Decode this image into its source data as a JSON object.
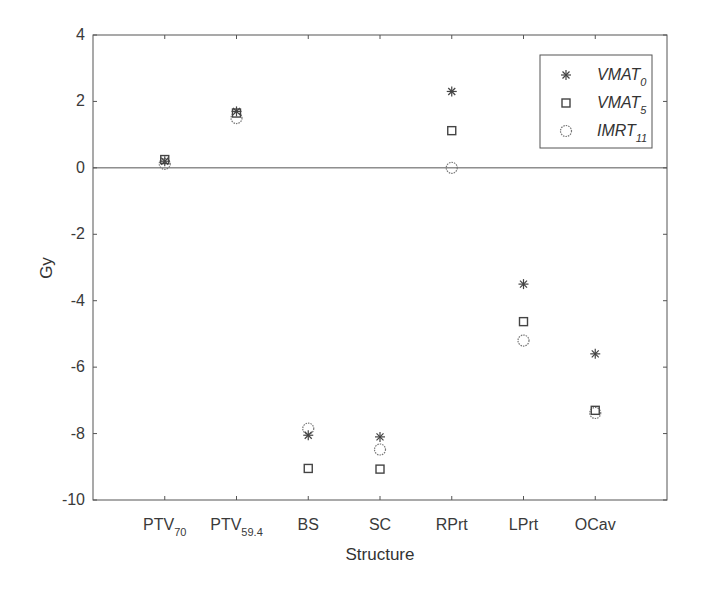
{
  "chart_data": {
    "type": "scatter",
    "title": "",
    "xlabel": "Structure",
    "ylabel": "Gy",
    "ylim": [
      -10,
      4
    ],
    "xlim": [
      0,
      8
    ],
    "yticks": [
      -10,
      -8,
      -6,
      -4,
      -2,
      0,
      2,
      4
    ],
    "grid": false,
    "zero_line": true,
    "legend_position": "upper right",
    "categories": [
      {
        "main": "PTV",
        "sub": "70"
      },
      {
        "main": "PTV",
        "sub": "59.4"
      },
      {
        "main": "BS",
        "sub": ""
      },
      {
        "main": "SC",
        "sub": ""
      },
      {
        "main": "RPrt",
        "sub": ""
      },
      {
        "main": "LPrt",
        "sub": ""
      },
      {
        "main": "OCav",
        "sub": ""
      }
    ],
    "series": [
      {
        "name": "VMAT",
        "sub": "0",
        "marker": "asterisk",
        "values": [
          0.2,
          1.7,
          -8.05,
          -8.1,
          2.3,
          -3.5,
          -5.6
        ]
      },
      {
        "name": "VMAT",
        "sub": "5",
        "marker": "square",
        "values": [
          0.25,
          1.65,
          -9.05,
          -9.07,
          1.12,
          -4.63,
          -7.3
        ]
      },
      {
        "name": "IMRT",
        "sub": "11",
        "marker": "circle",
        "values": [
          0.12,
          1.5,
          -7.85,
          -8.48,
          0.0,
          -5.2,
          -7.38
        ]
      }
    ]
  },
  "colors": {
    "axis": "#555555",
    "marker": "#444444",
    "text": "#333333"
  }
}
